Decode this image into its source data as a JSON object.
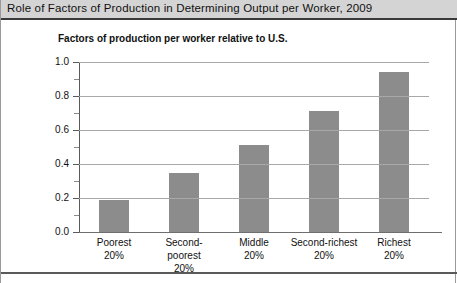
{
  "title": "Role of Factors of Production in Determining Output per Worker,  2009",
  "subtitle": "Factors of production per worker relative to U.S.",
  "chart_data": {
    "type": "bar",
    "title": "Role of Factors of Production in Determining Output per Worker,  2009",
    "subtitle": "Factors of production per worker relative to U.S.",
    "xlabel": "",
    "ylabel": "Factors of production per worker relative to U.S.",
    "categories": [
      "Poorest 20%",
      "Second-poorest 20%",
      "Middle 20%",
      "Second-richest 20%",
      "Richest 20%"
    ],
    "category_lines": [
      [
        "Poorest",
        "20%"
      ],
      [
        "Second-poorest",
        "20%"
      ],
      [
        "Middle",
        "20%"
      ],
      [
        "Second-richest",
        "20%"
      ],
      [
        "Richest",
        "20%"
      ]
    ],
    "values": [
      0.19,
      0.35,
      0.51,
      0.71,
      0.94
    ],
    "ylim": [
      0.0,
      1.0
    ],
    "ytick_labels": [
      "0.0",
      "0.2",
      "0.4",
      "0.6",
      "0.8",
      "1.0"
    ],
    "ytick_values": [
      0.0,
      0.2,
      0.4,
      0.6,
      0.8,
      1.0
    ],
    "yminor_values": [
      0.1,
      0.3,
      0.5,
      0.7,
      0.9
    ],
    "grid": true,
    "legend": "none",
    "bar_color": "#8c8c8c",
    "grid_color": "#a8a8a8",
    "axis_color": "#5a5a5a",
    "title_band_color": "#d4d4d4"
  }
}
